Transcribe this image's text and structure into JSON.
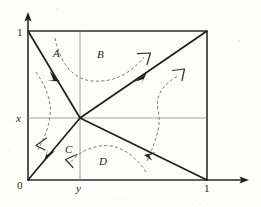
{
  "figure": {
    "type": "phase-portrait",
    "axes": {
      "x_axis_label": "",
      "y_axis_label": "",
      "tick_origin": "0",
      "tick_x_one": "1",
      "tick_y_one": "1",
      "gridline_y_label": "x",
      "gridline_x_label": "y"
    },
    "region_labels": [
      {
        "id": "A",
        "text": "A"
      },
      {
        "id": "B",
        "text": "B"
      },
      {
        "id": "C",
        "text": "C"
      },
      {
        "id": "D",
        "text": "D"
      }
    ],
    "separatrices": [
      {
        "id": "anti-diagonal",
        "from": "(0,1)",
        "to": "(1,0)",
        "arrow_direction": "down-right",
        "style": "solid"
      },
      {
        "id": "main-diagonal",
        "from": "(0,0)",
        "to": "(1,1)",
        "arrow_direction": "up-right",
        "style": "solid"
      }
    ],
    "trajectories": [
      {
        "id": "traj-B",
        "region": "B",
        "arrow_direction": "up-right",
        "style": "dashed"
      },
      {
        "id": "traj-right",
        "region": "right",
        "arrow_direction": "up-right",
        "style": "dashed"
      },
      {
        "id": "traj-left",
        "region": "left",
        "arrow_direction": "down-left",
        "style": "dashed"
      },
      {
        "id": "traj-D",
        "region": "D",
        "arrow_direction": "down-left",
        "style": "dashed"
      }
    ],
    "colors": {
      "ink": "#1e1e1c",
      "grid": "#8d8d86",
      "dashed": "#7d7d74",
      "paper": "#fdfdfb"
    }
  }
}
